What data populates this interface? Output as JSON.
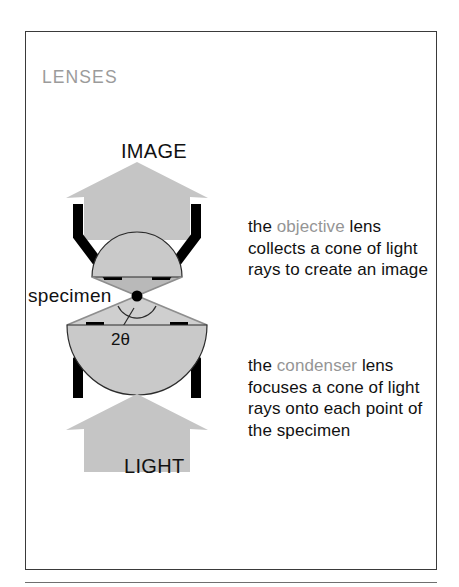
{
  "figure": {
    "section_title": "LENSES",
    "border_color": "#3a3a3a",
    "accent_gray": "#959595",
    "fill_gray": "#c9c9c9",
    "ink": "#111111"
  },
  "diagram": {
    "top_arrow_label": "IMAGE",
    "bottom_arrow_label": "LIGHT",
    "specimen_label": "specimen",
    "angle_label": "2θ",
    "parts": {
      "objective_lens": "objective-lens-semicircle",
      "condenser_lens": "condenser-lens-semicircle",
      "objective_mount": "objective-lens-mount-arms",
      "condenser_mount": "condenser-lens-mount-arms",
      "specimen_point": "specimen-point-dot",
      "light_cone_upper": "upper-light-cone",
      "light_cone_lower": "lower-light-cone",
      "angle_arc": "aperture-angle-arc",
      "angle_leader": "angle-leader-line"
    }
  },
  "captions": {
    "objective": {
      "lead": "the ",
      "term": "objective",
      "rest": " lens collects a cone of light rays to create an image"
    },
    "condenser": {
      "lead": "the ",
      "term": "condenser",
      "rest": " lens focuses a cone of light rays onto each point of the specimen"
    }
  }
}
